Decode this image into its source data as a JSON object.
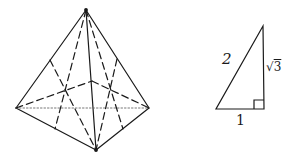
{
  "figure": {
    "pyramid": {
      "description": "Tetrahedron with dashed internal median lines",
      "vertices": {
        "apex": [
          86,
          10
        ],
        "left": [
          16,
          108
        ],
        "front": [
          96,
          150
        ],
        "right": [
          149,
          108
        ],
        "back": [
          92,
          81
        ]
      }
    },
    "triangle": {
      "description": "30-60-90 right triangle",
      "labels": {
        "hypotenuse": "2",
        "base": "1",
        "leg_radical": "√",
        "leg_value": "3"
      }
    }
  },
  "colors": {
    "stroke": "#1a1a1a",
    "background": "#ffffff"
  }
}
